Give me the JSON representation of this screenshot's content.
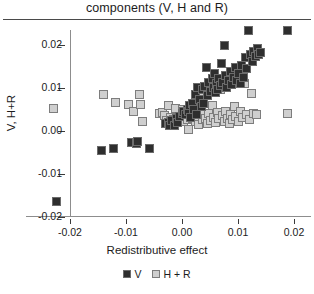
{
  "chart_data": {
    "type": "scatter",
    "title": "components (V, H and R)",
    "xlabel": "Redistributive effect",
    "ylabel": "V, H+R",
    "xlim": [
      -0.0235,
      0.0215
    ],
    "ylim": [
      -0.021,
      0.0255
    ],
    "grid": false,
    "legend_position": "bottom-center",
    "xticks": [
      "-0.02",
      "-0.01",
      "0.00",
      "0.01",
      "0.02"
    ],
    "xtick_values": [
      -0.02,
      -0.01,
      0.0,
      0.01,
      0.02
    ],
    "yticks": [
      "0.02",
      "0.01",
      "0.00",
      "-0.01",
      "-0.02"
    ],
    "ytick_values": [
      0.02,
      0.01,
      0.0,
      -0.01,
      -0.02
    ],
    "series": [
      {
        "name": "V",
        "marker": "square",
        "color": "#2e2e2e",
        "edge_color": "#6b6b6b",
        "points": [
          [
            -0.0225,
            -0.0163
          ],
          [
            -0.0143,
            -0.0044
          ],
          [
            -0.0122,
            -0.004
          ],
          [
            -0.009,
            -0.0026
          ],
          [
            -0.0082,
            -0.0029
          ],
          [
            -0.008,
            -0.0024
          ],
          [
            -0.0058,
            -0.004
          ],
          [
            -0.003,
            0.0018
          ],
          [
            -0.0025,
            0.002
          ],
          [
            -0.0022,
            0.0013
          ],
          [
            -0.0018,
            0.0024
          ],
          [
            -0.0014,
            0.0012
          ],
          [
            -0.001,
            0.0029
          ],
          [
            -0.0008,
            0.002
          ],
          [
            -0.0004,
            0.0034
          ],
          [
            0.0,
            0.004
          ],
          [
            0.0003,
            0.0046
          ],
          [
            0.0006,
            0.0038
          ],
          [
            0.0009,
            0.005
          ],
          [
            0.0012,
            0.0044
          ],
          [
            0.0014,
            0.0058
          ],
          [
            0.0016,
            0.0031
          ],
          [
            0.0019,
            0.0064
          ],
          [
            0.0021,
            0.0049
          ],
          [
            0.0024,
            0.0085
          ],
          [
            0.0026,
            0.0038
          ],
          [
            0.0028,
            0.01
          ],
          [
            0.0031,
            0.0072
          ],
          [
            0.0034,
            0.0056
          ],
          [
            0.0036,
            0.0095
          ],
          [
            0.0038,
            0.0064
          ],
          [
            0.0041,
            0.0104
          ],
          [
            0.0044,
            0.0147
          ],
          [
            0.0046,
            0.0082
          ],
          [
            0.0048,
            0.0113
          ],
          [
            0.0051,
            0.0092
          ],
          [
            0.0054,
            0.0122
          ],
          [
            0.0056,
            0.0101
          ],
          [
            0.0058,
            0.0133
          ],
          [
            0.006,
            0.0088
          ],
          [
            0.0062,
            0.0109
          ],
          [
            0.0064,
            0.0096
          ],
          [
            0.0066,
            0.0121
          ],
          [
            0.0068,
            0.0105
          ],
          [
            0.007,
            0.0156
          ],
          [
            0.0072,
            0.0113
          ],
          [
            0.0075,
            0.0198
          ],
          [
            0.0078,
            0.0128
          ],
          [
            0.008,
            0.01
          ],
          [
            0.0083,
            0.0116
          ],
          [
            0.0086,
            0.0138
          ],
          [
            0.0089,
            0.0108
          ],
          [
            0.0092,
            0.0125
          ],
          [
            0.0095,
            0.0147
          ],
          [
            0.0098,
            0.0118
          ],
          [
            0.0101,
            0.0134
          ],
          [
            0.0104,
            0.011
          ],
          [
            0.0107,
            0.0152
          ],
          [
            0.011,
            0.0125
          ],
          [
            0.0113,
            0.0169
          ],
          [
            0.0116,
            0.0145
          ],
          [
            0.0119,
            0.0232
          ],
          [
            0.0122,
            0.0178
          ],
          [
            0.0125,
            0.016
          ],
          [
            0.0128,
            0.0183
          ],
          [
            0.0131,
            0.0172
          ],
          [
            0.0134,
            0.019
          ],
          [
            0.0137,
            0.0176
          ],
          [
            0.0141,
            0.0182
          ],
          [
            0.0189,
            0.0232
          ]
        ]
      },
      {
        "name": "H + R",
        "marker": "square",
        "color": "#cfcfcf",
        "edge_color": "#7d7d7d",
        "points": [
          [
            -0.0229,
            0.0051
          ],
          [
            -0.0141,
            0.0084
          ],
          [
            -0.0118,
            0.0067
          ],
          [
            -0.0096,
            0.0061
          ],
          [
            -0.0086,
            0.0046
          ],
          [
            -0.0076,
            0.0085
          ],
          [
            -0.0074,
            0.0062
          ],
          [
            -0.007,
            0.0023
          ],
          [
            -0.004,
            0.004
          ],
          [
            -0.0035,
            0.0043
          ],
          [
            -0.0031,
            0.0036
          ],
          [
            -0.0028,
            0.0024
          ],
          [
            -0.0024,
            0.006
          ],
          [
            -0.002,
            0.0032
          ],
          [
            -0.0016,
            0.0027
          ],
          [
            -0.0012,
            0.0052
          ],
          [
            -0.0008,
            0.0025
          ],
          [
            -0.0004,
            0.0029
          ],
          [
            0.0,
            0.0049
          ],
          [
            0.0003,
            0.0021
          ],
          [
            0.0006,
            0.0034
          ],
          [
            0.0009,
            0.0026
          ],
          [
            0.0012,
            0.0003
          ],
          [
            0.0015,
            0.004
          ],
          [
            0.0018,
            0.0028
          ],
          [
            0.0021,
            0.0058
          ],
          [
            0.0024,
            0.0022
          ],
          [
            0.0027,
            0.0033
          ],
          [
            0.003,
            0.0016
          ],
          [
            0.0033,
            0.0044
          ],
          [
            0.0036,
            0.0027
          ],
          [
            0.0039,
            0.0086
          ],
          [
            0.0042,
            0.003
          ],
          [
            0.0045,
            0.0018
          ],
          [
            0.0048,
            0.004
          ],
          [
            0.0051,
            0.0024
          ],
          [
            0.0054,
            0.006
          ],
          [
            0.0057,
            0.0031
          ],
          [
            0.006,
            0.0019
          ],
          [
            0.0063,
            0.0043
          ],
          [
            0.0066,
            0.0028
          ],
          [
            0.0069,
            0.0097
          ],
          [
            0.0072,
            0.0036
          ],
          [
            0.0075,
            0.0021
          ],
          [
            0.0078,
            0.0046
          ],
          [
            0.0081,
            0.003
          ],
          [
            0.0084,
            0.0017
          ],
          [
            0.0087,
            0.0039
          ],
          [
            0.009,
            0.0026
          ],
          [
            0.0093,
            0.0056
          ],
          [
            0.0096,
            0.0033
          ],
          [
            0.01,
            0.0021
          ],
          [
            0.0104,
            0.0044
          ],
          [
            0.0108,
            0.0031
          ],
          [
            0.0112,
            0.011
          ],
          [
            0.0116,
            0.0039
          ],
          [
            0.012,
            0.0027
          ],
          [
            0.0124,
            0.0086
          ],
          [
            0.0128,
            0.004
          ],
          [
            0.0133,
            0.0038
          ],
          [
            0.0188,
            0.004
          ]
        ]
      }
    ]
  }
}
